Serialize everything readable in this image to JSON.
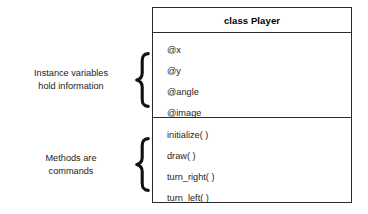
{
  "diagram": {
    "type": "uml-class-diagram",
    "class_box": {
      "title": "class Player",
      "attributes": [
        "@x",
        "@y",
        "@angle",
        "@image"
      ],
      "methods": [
        "initialize( )",
        "draw( )",
        "turn_right( )",
        "turn_left( )"
      ]
    },
    "annotations": [
      {
        "id": "instance-variables",
        "line1": "Instance variables",
        "line2": "hold information",
        "brace": "left-curly-brace"
      },
      {
        "id": "methods",
        "line1": "Methods are",
        "line2": "commands",
        "brace": "left-curly-brace"
      }
    ],
    "colors": {
      "background": "#ffffff",
      "border": "#2b2b2b",
      "text": "#1c1c1c",
      "title_text": "#000000"
    }
  }
}
